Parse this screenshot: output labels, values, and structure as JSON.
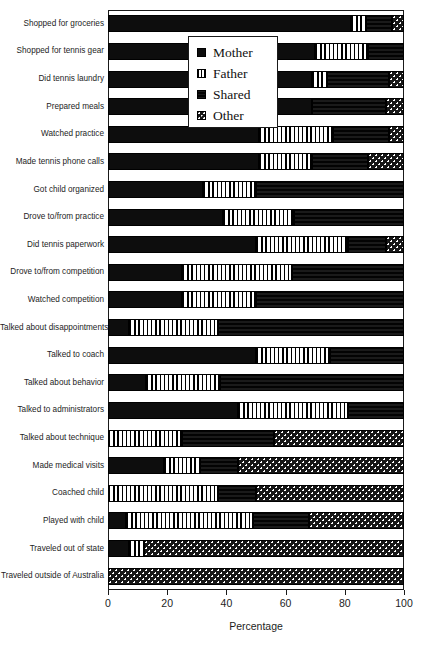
{
  "chart_data": {
    "type": "bar",
    "orientation": "horizontal",
    "stacked": true,
    "title": "",
    "xlabel": "Percentage",
    "ylabel": "",
    "xlim": [
      0,
      100
    ],
    "xticks": [
      0,
      20,
      40,
      60,
      80,
      100
    ],
    "xticklabels": [
      "0",
      "20",
      "40",
      "60",
      "80",
      "100"
    ],
    "grid": false,
    "legend_position": "upper center inside",
    "legend": [
      "Mother",
      "Father",
      "Shared",
      "Other"
    ],
    "categories": [
      "Shopped for groceries",
      "Shopped for tennis gear",
      "Did tennis laundry",
      "Prepared meals",
      "Watched practice",
      "Made tennis phone calls",
      "Got child organized",
      "Drove to/from practice",
      "Did tennis paperwork",
      "Drove to/from competition",
      "Watched competition",
      "Talked about disappointments",
      "Talked to coach",
      "Talked about behavior",
      "Talked to administrators",
      "Talked about technique",
      "Made medical visits",
      "Coached child",
      "Played with child",
      "Traveled out of state",
      "Traveled outside of Australia"
    ],
    "series": [
      {
        "name": "Mother",
        "values": [
          82,
          70,
          69,
          69,
          51,
          51,
          32,
          39,
          50,
          25,
          25,
          7,
          50,
          13,
          44,
          0,
          19,
          0,
          6,
          7,
          0
        ]
      },
      {
        "name": "Father",
        "values": [
          5,
          18,
          5,
          0,
          25,
          18,
          18,
          24,
          31,
          37,
          25,
          30,
          25,
          25,
          37,
          25,
          12,
          37,
          43,
          5,
          0
        ]
      },
      {
        "name": "Shared",
        "values": [
          9,
          12,
          21,
          25,
          19,
          19,
          50,
          37,
          13,
          38,
          50,
          63,
          25,
          62,
          19,
          31,
          13,
          13,
          19,
          0,
          0
        ]
      },
      {
        "name": "Other",
        "values": [
          4,
          0,
          5,
          6,
          5,
          12,
          0,
          0,
          6,
          0,
          0,
          0,
          0,
          0,
          0,
          44,
          56,
          50,
          32,
          88,
          100
        ]
      }
    ]
  },
  "axis": {
    "x_title": "Percentage"
  }
}
